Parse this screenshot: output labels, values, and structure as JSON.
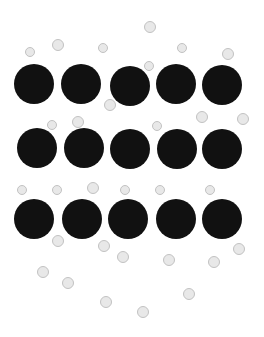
{
  "figure": {
    "width": 264,
    "height": 337,
    "background_color": "#ffffff",
    "large_particle_color": "#111111",
    "small_particle_fill": "#e8e8e8",
    "small_particle_border": "#c2c2c2"
  },
  "chart_data": {
    "type": "scatter",
    "title": "",
    "subtitle": "",
    "xlabel": "",
    "ylabel": "",
    "xlim": [
      0,
      264
    ],
    "ylim": [
      0,
      337
    ],
    "grid": false,
    "legend": "none",
    "annotations": [],
    "series": [
      {
        "name": "large-particles",
        "marker": "filled-circle",
        "color": "#111111",
        "diameter": 40,
        "count": 15,
        "points": [
          {
            "x": 34,
            "y": 84,
            "r": 20
          },
          {
            "x": 81,
            "y": 84,
            "r": 20
          },
          {
            "x": 130,
            "y": 86,
            "r": 20
          },
          {
            "x": 176,
            "y": 84,
            "r": 20
          },
          {
            "x": 222,
            "y": 85,
            "r": 20
          },
          {
            "x": 37,
            "y": 148,
            "r": 20
          },
          {
            "x": 84,
            "y": 148,
            "r": 20
          },
          {
            "x": 130,
            "y": 149,
            "r": 20
          },
          {
            "x": 177,
            "y": 149,
            "r": 20
          },
          {
            "x": 222,
            "y": 149,
            "r": 20
          },
          {
            "x": 34,
            "y": 219,
            "r": 20
          },
          {
            "x": 82,
            "y": 219,
            "r": 20
          },
          {
            "x": 128,
            "y": 219,
            "r": 20
          },
          {
            "x": 176,
            "y": 219,
            "r": 20
          },
          {
            "x": 222,
            "y": 219,
            "r": 20
          }
        ]
      },
      {
        "name": "small-particles",
        "marker": "outlined-circle",
        "color": "#e8e8e8",
        "edge_color": "#c2c2c2",
        "diameter": 11,
        "count": 36,
        "points": [
          {
            "x": 150,
            "y": 27,
            "r": 6
          },
          {
            "x": 58,
            "y": 45,
            "r": 6
          },
          {
            "x": 103,
            "y": 48,
            "r": 5
          },
          {
            "x": 182,
            "y": 48,
            "r": 5
          },
          {
            "x": 30,
            "y": 52,
            "r": 5
          },
          {
            "x": 228,
            "y": 54,
            "r": 6
          },
          {
            "x": 149,
            "y": 66,
            "r": 5
          },
          {
            "x": 110,
            "y": 105,
            "r": 6
          },
          {
            "x": 202,
            "y": 117,
            "r": 6
          },
          {
            "x": 243,
            "y": 119,
            "r": 6
          },
          {
            "x": 78,
            "y": 122,
            "r": 6
          },
          {
            "x": 52,
            "y": 125,
            "r": 5
          },
          {
            "x": 157,
            "y": 126,
            "r": 5
          },
          {
            "x": 93,
            "y": 188,
            "r": 6
          },
          {
            "x": 22,
            "y": 190,
            "r": 5
          },
          {
            "x": 57,
            "y": 190,
            "r": 5
          },
          {
            "x": 125,
            "y": 190,
            "r": 5
          },
          {
            "x": 160,
            "y": 190,
            "r": 5
          },
          {
            "x": 210,
            "y": 190,
            "r": 5
          },
          {
            "x": 58,
            "y": 241,
            "r": 6
          },
          {
            "x": 104,
            "y": 246,
            "r": 6
          },
          {
            "x": 239,
            "y": 249,
            "r": 6
          },
          {
            "x": 123,
            "y": 257,
            "r": 6
          },
          {
            "x": 169,
            "y": 260,
            "r": 6
          },
          {
            "x": 214,
            "y": 262,
            "r": 6
          },
          {
            "x": 43,
            "y": 272,
            "r": 6
          },
          {
            "x": 68,
            "y": 283,
            "r": 6
          },
          {
            "x": 189,
            "y": 294,
            "r": 6
          },
          {
            "x": 106,
            "y": 302,
            "r": 6
          },
          {
            "x": 143,
            "y": 312,
            "r": 6
          }
        ]
      }
    ]
  }
}
